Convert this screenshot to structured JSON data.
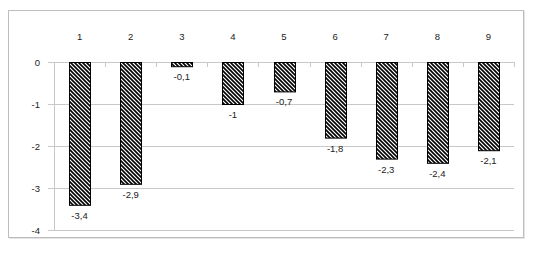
{
  "chart_data": {
    "type": "bar",
    "title": "",
    "xlabel": "",
    "ylabel": "",
    "categories": [
      "1",
      "2",
      "3",
      "4",
      "5",
      "6",
      "7",
      "8",
      "9"
    ],
    "values": [
      -3.4,
      -2.9,
      -0.1,
      -1,
      -0.7,
      -1.8,
      -2.3,
      -2.4,
      -2.1
    ],
    "value_labels": [
      "-3,4",
      "-2,9",
      "-0,1",
      "-1",
      "-0,7",
      "-1,8",
      "-2,3",
      "-2,4",
      "-2,1"
    ],
    "ylim": [
      -4,
      0
    ],
    "yticks": [
      0,
      -1,
      -2,
      -3,
      -4
    ],
    "ytick_labels": [
      "0",
      "-1",
      "-2",
      "-3",
      "-4"
    ],
    "category_axis_position": "top",
    "grid": true,
    "legend": null,
    "bar_fill": "diagonal-hatch",
    "colors": {
      "bar_stroke": "#000000",
      "hatch": "#000000",
      "grid": "#c8c8c8",
      "frame": "#bdbdbd"
    }
  }
}
